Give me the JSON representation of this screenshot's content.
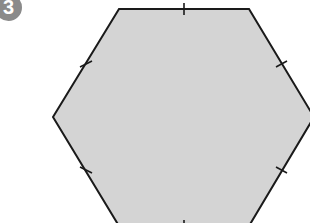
{
  "question": {
    "number": "3"
  },
  "figure": {
    "shape": "regular-hexagon",
    "fill_color": "#d4d4d4",
    "stroke_color": "#1a1a1a",
    "equal_side_tick_marks": 6,
    "vertices": [
      [
        119,
        9
      ],
      [
        249,
        9
      ],
      [
        314,
        117
      ],
      [
        249,
        226
      ],
      [
        119,
        226
      ],
      [
        53,
        117
      ]
    ]
  }
}
